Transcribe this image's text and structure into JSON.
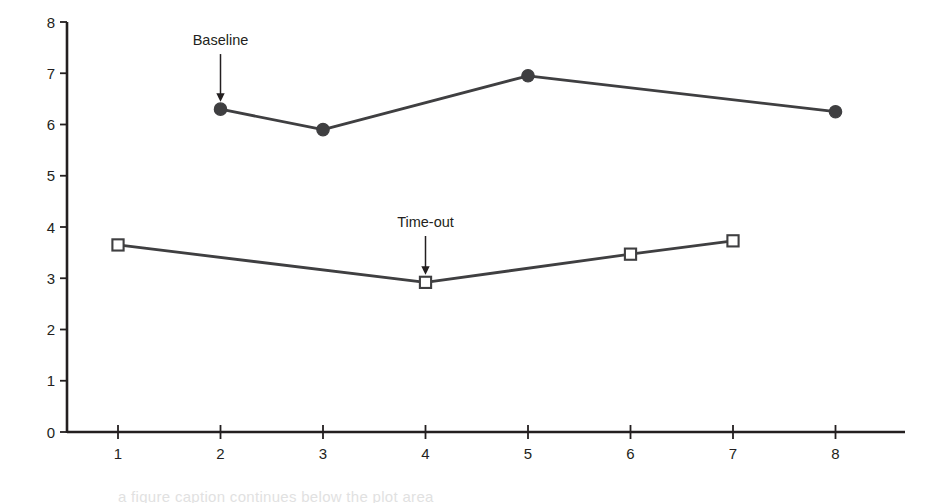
{
  "chart_data": {
    "type": "line",
    "title": "",
    "subtitle": "",
    "xlabel": "Sessions",
    "ylabel": "Sorting responses per minute",
    "xlim": [
      0.4,
      8.6
    ],
    "ylim": [
      0,
      8
    ],
    "xticks": [
      "1",
      "2",
      "3",
      "4",
      "5",
      "6",
      "7",
      "8"
    ],
    "xtick_values": [
      1,
      2,
      3,
      4,
      5,
      6,
      7,
      8
    ],
    "yticks": [
      "0",
      "1",
      "2",
      "3",
      "4",
      "5",
      "6",
      "7",
      "8"
    ],
    "ytick_values": [
      0,
      1,
      2,
      3,
      4,
      5,
      6,
      7,
      8
    ],
    "grid": false,
    "legend": "none",
    "series": [
      {
        "name": "Baseline",
        "marker": "filled-circle",
        "color": "#3f3f41",
        "x": [
          2,
          3,
          5,
          8
        ],
        "values": [
          6.3,
          5.9,
          6.95,
          6.25
        ],
        "line_x": [
          2,
          3,
          5,
          8
        ],
        "line_values": [
          6.3,
          5.9,
          6.95,
          6.25
        ]
      },
      {
        "name": "Time-out",
        "marker": "open-square",
        "color": "#3f3f41",
        "x": [
          1,
          4,
          6,
          7
        ],
        "values": [
          3.65,
          2.92,
          3.47,
          3.73
        ],
        "line_x": [
          1,
          4,
          6,
          7
        ],
        "line_values": [
          3.65,
          2.92,
          3.47,
          3.73
        ]
      }
    ],
    "annotations": [
      {
        "text": "Baseline",
        "target_x": 2,
        "target_y": 6.3,
        "label_x": 2.0,
        "label_y": 7.55,
        "arrow": "down"
      },
      {
        "text": "Time-out",
        "target_x": 4,
        "target_y": 2.92,
        "label_x": 4.0,
        "label_y": 4.0,
        "arrow": "down"
      }
    ]
  },
  "axis": {
    "x_title": "Sessions",
    "y_title": "Sorting responses per minute"
  },
  "colors": {
    "line": "#3f3f41",
    "axis": "#231f20",
    "marker_fill": "#3f3f41",
    "marker_open_fill": "#ffffff",
    "text": "#231f20",
    "background": "#ffffff"
  },
  "footer": {
    "cut_off_caption": "a figure caption continues below the plot area"
  }
}
